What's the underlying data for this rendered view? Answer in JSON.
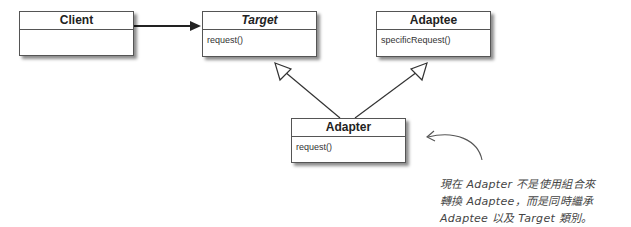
{
  "diagram": {
    "type": "UML class diagram",
    "classes": [
      {
        "id": "client",
        "name": "Client",
        "italic": false,
        "methods": []
      },
      {
        "id": "target",
        "name": "Target",
        "italic": true,
        "methods": [
          "request()"
        ]
      },
      {
        "id": "adaptee",
        "name": "Adaptee",
        "italic": false,
        "methods": [
          "specificRequest()"
        ]
      },
      {
        "id": "adapter",
        "name": "Adapter",
        "italic": false,
        "methods": [
          "request()"
        ]
      }
    ],
    "relations": [
      {
        "from": "Client",
        "to": "Target",
        "kind": "association"
      },
      {
        "from": "Adapter",
        "to": "Target",
        "kind": "generalization"
      },
      {
        "from": "Adapter",
        "to": "Adaptee",
        "kind": "generalization"
      }
    ],
    "annotation": {
      "lines": [
        "現在 Adapter 不是使用組合來",
        "轉換 Adaptee，而是同時繼承",
        "Adaptee 以及 Target 類別。"
      ],
      "points_to": "Adapter"
    }
  },
  "colors": {
    "line": "#333333",
    "box_border": "#555555",
    "note_text": "#444444"
  }
}
